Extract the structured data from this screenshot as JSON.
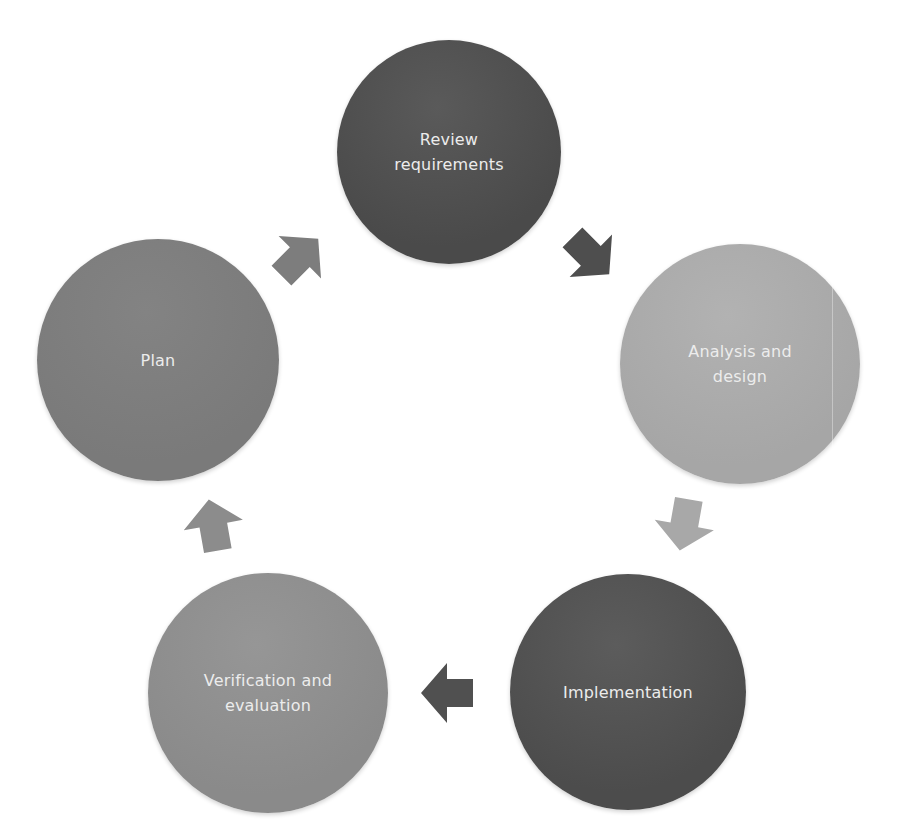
{
  "diagram": {
    "type": "cycle",
    "nodes": [
      {
        "id": "review",
        "label": "Review\nrequirements",
        "color": "#4a4a4a",
        "color_light": "#5a5a5a",
        "cx": 449,
        "cy": 152,
        "r": 112
      },
      {
        "id": "analysis",
        "label": "Analysis and\ndesign",
        "color": "#a6a6a6",
        "color_light": "#b2b2b2",
        "cx": 740,
        "cy": 364,
        "r": 120
      },
      {
        "id": "implementation",
        "label": "Implementation",
        "color": "#4c4c4c",
        "color_light": "#5c5c5c",
        "cx": 628,
        "cy": 692,
        "r": 118
      },
      {
        "id": "verification",
        "label": "Verification and\nevaluation",
        "color": "#8a8a8a",
        "color_light": "#969696",
        "cx": 268,
        "cy": 693,
        "r": 120
      },
      {
        "id": "plan",
        "label": "Plan",
        "color": "#7a7a7a",
        "color_light": "#838383",
        "cx": 158,
        "cy": 360,
        "r": 121
      }
    ],
    "arrows": [
      {
        "from": "plan",
        "to": "review",
        "color": "#7d7d7d",
        "cx": 297,
        "cy": 260,
        "angle": -45
      },
      {
        "from": "review",
        "to": "analysis",
        "color": "#4e4e4e",
        "cx": 588,
        "cy": 253,
        "angle": 45
      },
      {
        "from": "analysis",
        "to": "implementation",
        "color": "#a8a8a8",
        "cx": 685,
        "cy": 521,
        "angle": 100
      },
      {
        "from": "implementation",
        "to": "verification",
        "color": "#505050",
        "cx": 451,
        "cy": 693,
        "angle": 180
      },
      {
        "from": "verification",
        "to": "plan",
        "color": "#8c8c8c",
        "cx": 214,
        "cy": 529,
        "angle": -100
      }
    ]
  }
}
